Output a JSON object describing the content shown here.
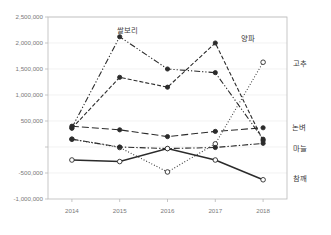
{
  "chart_data": {
    "type": "line",
    "title": "",
    "xlabel": "",
    "ylabel": "",
    "categories": [
      "2014",
      "2015",
      "2016",
      "2017",
      "2018"
    ],
    "x_tick_labels": [
      "2014",
      "2015",
      "2016",
      "2017",
      "2018"
    ],
    "y_tick_labels": [
      "2,500,000",
      "2,000,000",
      "1,500,000",
      "1,000,000",
      "500,000",
      "",
      "-500,000",
      "-1,000,000"
    ],
    "y_tick_values": [
      2500000,
      2000000,
      1500000,
      1000000,
      500000,
      0,
      -500000,
      -1000000
    ],
    "ylim": [
      -1000000,
      2500000
    ],
    "grid": true,
    "legend_position": "inline-endpoint-labels",
    "series": [
      {
        "name": "쌀보리",
        "label": "쌀보리",
        "label_position": "above-2015-peak",
        "line_style": "dash-dot-dot",
        "marker": "filled-circle",
        "color": "#2b2b2b",
        "values": [
          370000,
          2120000,
          1500000,
          1430000,
          150000
        ]
      },
      {
        "name": "양파",
        "label": "양파",
        "label_position": "above-2017-peak",
        "line_style": "dashed",
        "marker": "filled-circle",
        "color": "#2b2b2b",
        "values": [
          360000,
          1340000,
          1150000,
          2000000,
          120000
        ]
      },
      {
        "name": "고추",
        "label": "고추",
        "label_position": "right-of-2018",
        "line_style": "dotted",
        "marker": "open-circle",
        "color": "#2b2b2b",
        "values": [
          150000,
          -10000,
          -480000,
          60000,
          1630000
        ]
      },
      {
        "name": "논벼",
        "label": "논벼",
        "label_position": "right-of-2018",
        "line_style": "long-dash",
        "marker": "filled-circle",
        "color": "#2b2b2b",
        "values": [
          400000,
          330000,
          200000,
          300000,
          370000
        ]
      },
      {
        "name": "마늘",
        "label": "마늘",
        "label_position": "right-of-2018",
        "line_style": "dash-dot",
        "marker": "filled-circle",
        "color": "#2b2b2b",
        "values": [
          150000,
          0,
          -30000,
          -10000,
          70000
        ]
      },
      {
        "name": "참깨",
        "label": "참깨",
        "label_position": "right-of-2018",
        "line_style": "solid",
        "marker": "open-circle",
        "color": "#2b2b2b",
        "values": [
          -250000,
          -280000,
          -30000,
          -250000,
          -630000
        ]
      }
    ]
  }
}
